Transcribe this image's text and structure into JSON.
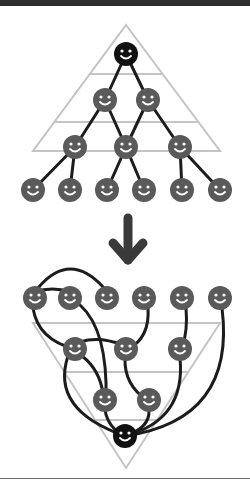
{
  "colors": {
    "topbar": "#2e2e2e",
    "guide": "#c4c4c4",
    "edge": "#1c1c1c",
    "node": "#5a5a5a",
    "root_node": "#111111",
    "face": "#ffffff",
    "arrow": "#3a3a3a",
    "rule": "#6a6a6a"
  },
  "top_diagram": {
    "label": "hierarchy",
    "nodes": [
      {
        "id": "r",
        "x": 126,
        "y": 54,
        "kind": "root"
      },
      {
        "id": "a1",
        "x": 105,
        "y": 100,
        "kind": "member"
      },
      {
        "id": "a2",
        "x": 148,
        "y": 100,
        "kind": "member"
      },
      {
        "id": "b1",
        "x": 75,
        "y": 147,
        "kind": "member"
      },
      {
        "id": "b2",
        "x": 126,
        "y": 147,
        "kind": "member"
      },
      {
        "id": "b3",
        "x": 180,
        "y": 147,
        "kind": "member"
      },
      {
        "id": "c1",
        "x": 33,
        "y": 190,
        "kind": "member"
      },
      {
        "id": "c2",
        "x": 70,
        "y": 190,
        "kind": "member"
      },
      {
        "id": "c3",
        "x": 107,
        "y": 190,
        "kind": "member"
      },
      {
        "id": "c4",
        "x": 144,
        "y": 190,
        "kind": "member"
      },
      {
        "id": "c5",
        "x": 182,
        "y": 190,
        "kind": "member"
      },
      {
        "id": "c6",
        "x": 220,
        "y": 190,
        "kind": "member"
      }
    ],
    "edges": [
      [
        "r",
        "a1"
      ],
      [
        "r",
        "a2"
      ],
      [
        "a1",
        "b1"
      ],
      [
        "a1",
        "b2"
      ],
      [
        "a2",
        "b2"
      ],
      [
        "a2",
        "b3"
      ],
      [
        "b1",
        "c1"
      ],
      [
        "b1",
        "c2"
      ],
      [
        "b2",
        "c3"
      ],
      [
        "b2",
        "c4"
      ],
      [
        "b3",
        "c5"
      ],
      [
        "b3",
        "c6"
      ]
    ]
  },
  "arrow": {
    "direction": "down",
    "icon": "arrow-down-icon"
  },
  "bottom_diagram": {
    "label": "network",
    "nodes": [
      {
        "id": "t1",
        "x": 35,
        "y": 298,
        "kind": "member"
      },
      {
        "id": "t2",
        "x": 70,
        "y": 298,
        "kind": "member"
      },
      {
        "id": "t3",
        "x": 107,
        "y": 298,
        "kind": "member"
      },
      {
        "id": "t4",
        "x": 144,
        "y": 298,
        "kind": "member"
      },
      {
        "id": "t5",
        "x": 182,
        "y": 298,
        "kind": "member"
      },
      {
        "id": "t6",
        "x": 220,
        "y": 298,
        "kind": "member"
      },
      {
        "id": "m1",
        "x": 75,
        "y": 349,
        "kind": "member"
      },
      {
        "id": "m2",
        "x": 126,
        "y": 349,
        "kind": "member"
      },
      {
        "id": "m3",
        "x": 180,
        "y": 349,
        "kind": "member"
      },
      {
        "id": "l1",
        "x": 105,
        "y": 400,
        "kind": "member"
      },
      {
        "id": "l2",
        "x": 149,
        "y": 400,
        "kind": "member"
      },
      {
        "id": "b",
        "x": 125,
        "y": 436,
        "kind": "root"
      }
    ]
  }
}
